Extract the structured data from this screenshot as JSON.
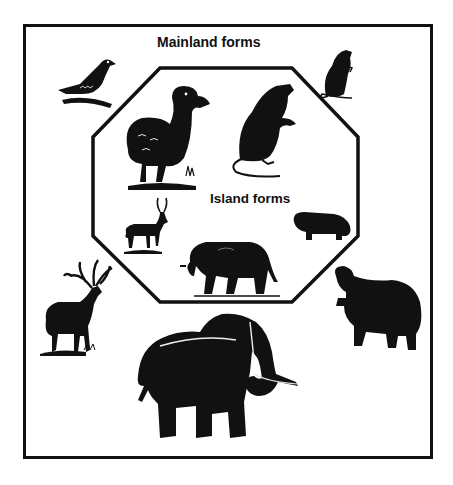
{
  "figure": {
    "mainland_label": "Mainland forms",
    "island_label": "Island forms",
    "caption_partial": "",
    "colors": {
      "ink": "#111111",
      "background": "#ffffff"
    },
    "mainland_animals": [
      {
        "name": "pigeon",
        "position": "top-left"
      },
      {
        "name": "rat",
        "position": "top-right",
        "size": "small"
      },
      {
        "name": "elk-deer",
        "position": "left",
        "size": "large"
      },
      {
        "name": "elephant",
        "position": "bottom-center",
        "size": "large"
      },
      {
        "name": "hippopotamus",
        "position": "right",
        "size": "large"
      }
    ],
    "island_animals": [
      {
        "name": "dodo",
        "position": "top-left",
        "size": "large"
      },
      {
        "name": "giant-rat",
        "position": "top-right",
        "size": "large"
      },
      {
        "name": "dwarf-deer",
        "position": "left",
        "size": "small"
      },
      {
        "name": "dwarf-elephant",
        "position": "bottom-center",
        "size": "small"
      },
      {
        "name": "pygmy-hippopotamus",
        "position": "right",
        "size": "small"
      }
    ]
  }
}
